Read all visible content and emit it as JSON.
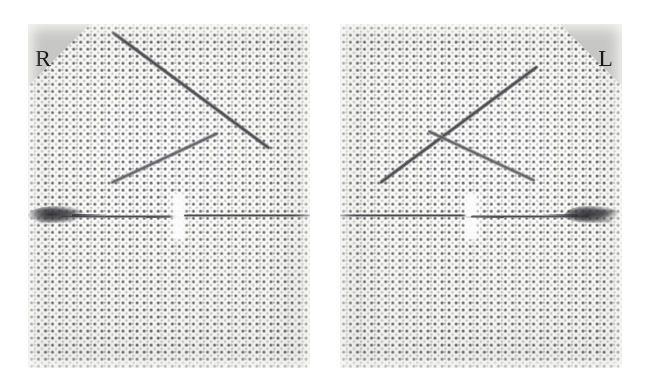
{
  "figure": {
    "kind": "stereo-radiograph-pair",
    "background_color": "#ffffff",
    "width": 648,
    "height": 389,
    "panel_count": 2
  },
  "panels": [
    {
      "id": "panel-right-marker",
      "marker_letter": "R",
      "marker_side": "left",
      "marker_color": "#c9c9c7",
      "marker_text_color": "#17171a",
      "position": {
        "x": 28,
        "y": 24,
        "width": 282,
        "height": 344
      },
      "background_color": "#fbfbfa",
      "grid": {
        "kind": "dot-matrix-phantom",
        "spacing_px": 7,
        "dot_color": "#28282a"
      },
      "objects": [
        {
          "name": "long-diagonal-rod",
          "orientation": "top-left-to-bottom-right"
        },
        {
          "name": "short-crossing-rod",
          "orientation": "bottom-left-to-top-right"
        },
        {
          "name": "horizontal-guide-wire",
          "orientation": "horizontal"
        },
        {
          "name": "wire-break-gap",
          "orientation": "vertical"
        },
        {
          "name": "dense-knot-blob",
          "side": "left"
        }
      ]
    },
    {
      "id": "panel-left-marker",
      "marker_letter": "L",
      "marker_side": "right",
      "marker_color": "#c9c9c7",
      "marker_text_color": "#17171a",
      "position": {
        "x": 340,
        "y": 24,
        "width": 282,
        "height": 344
      },
      "background_color": "#fbfbfa",
      "grid": {
        "kind": "dot-matrix-phantom",
        "spacing_px": 7,
        "dot_color": "#28282a"
      },
      "objects": [
        {
          "name": "long-diagonal-rod",
          "orientation": "bottom-left-to-top-right"
        },
        {
          "name": "short-crossing-rod",
          "orientation": "top-left-to-bottom-right"
        },
        {
          "name": "horizontal-guide-wire",
          "orientation": "horizontal"
        },
        {
          "name": "wire-break-gap",
          "orientation": "vertical"
        },
        {
          "name": "dense-knot-blob",
          "side": "right"
        }
      ]
    }
  ]
}
